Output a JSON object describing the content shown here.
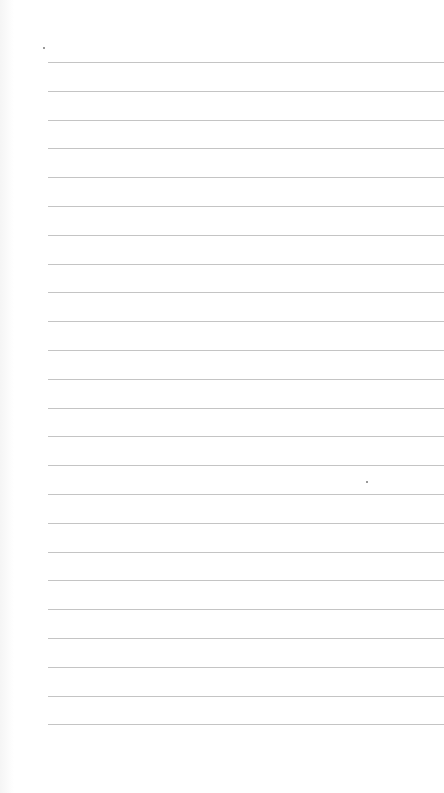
{
  "paper": {
    "background": "#ffffff",
    "rule_color": "#c4c4c4",
    "rule_left": 48,
    "first_rule_y": 62,
    "rule_spacing": 28.8,
    "rule_count": 24
  },
  "marks": [
    {
      "x": 43,
      "y": 47
    },
    {
      "x": 366,
      "y": 481
    }
  ]
}
